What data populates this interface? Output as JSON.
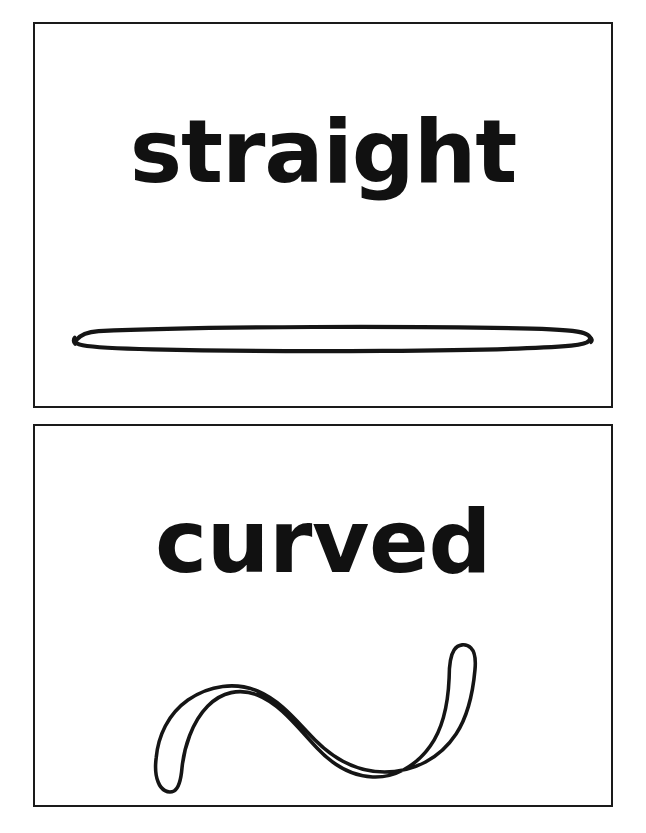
{
  "page": {
    "background_color": "#ffffff",
    "ink_color": "#151515",
    "border_color": "#1a1a1a"
  },
  "cards": [
    {
      "id": "straight",
      "word": "straight",
      "figure_name": "straight-line-rod-drawing",
      "figure_description": "long horizontal outlined rod with rounded ends"
    },
    {
      "id": "curved",
      "word": "curved",
      "figure_name": "curved-line-wave-drawing",
      "figure_description": "S-shaped outlined ribbon curving like a wave with a hooked right end"
    }
  ]
}
